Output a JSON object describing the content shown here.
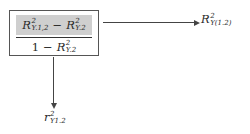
{
  "diagram": {
    "box": {
      "numerator": {
        "term1": {
          "base": "R",
          "sup": "2",
          "sub": "Y.1,2"
        },
        "operator": "−",
        "term2": {
          "base": "R",
          "sup": "2",
          "sub": "Y.2"
        },
        "highlight_color": "#cfcfcf"
      },
      "denominator": {
        "constant": "1",
        "operator": "−",
        "term": {
          "base": "R",
          "sup": "2",
          "sub": "Y.2"
        }
      }
    },
    "arrow_right_label": {
      "base": "R",
      "sup": "2",
      "sub": "Y(1.2)"
    },
    "arrow_down_label": {
      "base": "r",
      "sup": "2",
      "sub": "Y1.2"
    }
  }
}
